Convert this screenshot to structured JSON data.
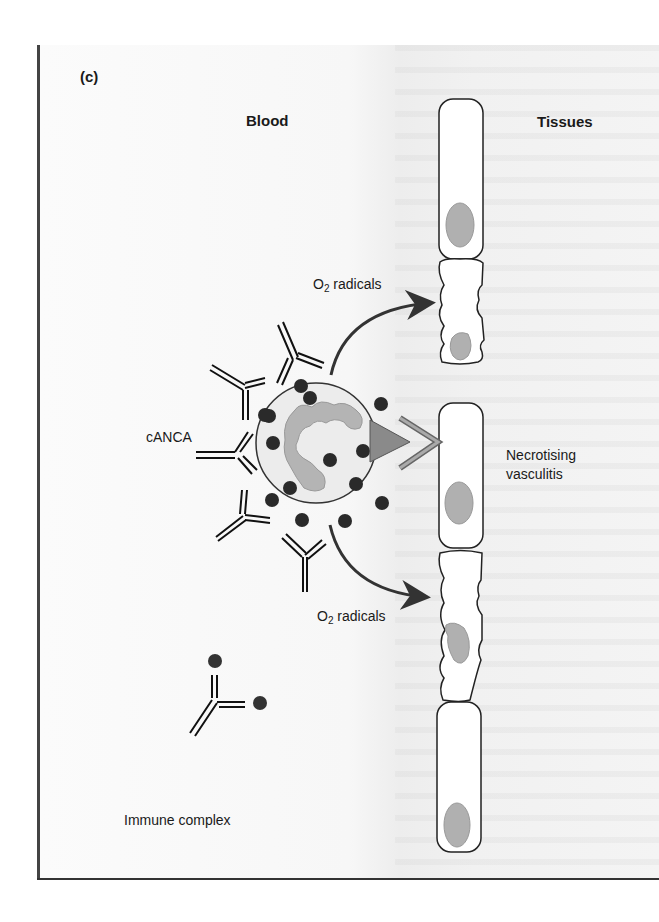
{
  "figure": {
    "panel_label": "(c)",
    "column_headers": {
      "left": "Blood",
      "right": "Tissues"
    },
    "labels": {
      "o2_radicals_top": {
        "prefix": "O",
        "subscript": "2",
        "suffix": " radicals"
      },
      "o2_radicals_bottom": {
        "prefix": "O",
        "subscript": "2",
        "suffix": " radicals"
      },
      "canca": "cANCA",
      "necrotising_line1": "Necrotising",
      "necrotising_line2": "vasculitis",
      "immune_complex": "Immune complex"
    },
    "colors": {
      "ink": "#1a1a1a",
      "neutrophil_fill": "#ececec",
      "nucleus_fill": "#b4b4b4",
      "granule": "#2a2a2a",
      "arrowhead_fill": "#8a8a8a",
      "cell_nucleus": "#b0b0b0"
    },
    "endothelial_cells": [
      {
        "state": "intact"
      },
      {
        "state": "damaged"
      },
      {
        "state": "intact"
      },
      {
        "state": "damaged"
      },
      {
        "state": "intact"
      }
    ]
  }
}
